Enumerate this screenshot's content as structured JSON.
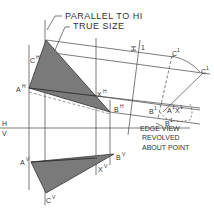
{
  "figure": {
    "callouts": {
      "parallel": "PARALLEL TO HI",
      "true_size": "TRUE SIZE",
      "edge_view_1": "EDGE VIEW",
      "edge_view_2": "REVOLVED",
      "edge_view_3": "ABOUT POINT"
    },
    "fold_lines": {
      "h": "H",
      "v": "V",
      "h_aux": "H",
      "one": "1"
    },
    "points": {
      "a_h": "A",
      "a_h_sup": "H",
      "c_h": "C",
      "c_h_sup": "H",
      "x_h": "X",
      "x_h_sup": "H",
      "b_h": "B",
      "b_h_sup": "H",
      "a_v": "A",
      "a_v_sup": "V",
      "c_v": "C",
      "c_v_sup": "V",
      "x_v": "X",
      "x_v_sup": "V",
      "b_v": "B",
      "b_v_sup": "V",
      "c_1": "C",
      "c_1_sup": "1",
      "c_1r": "C",
      "c_1r_sup": "1",
      "b_1": "B",
      "b_1_sup": "1",
      "b_1r": "B",
      "b_1r_sup": "1",
      "ax_1": "A",
      "ax_1_sup": "1",
      "ax_1b": "X",
      "ax_1b_sup": "1"
    },
    "colors": {
      "fill": "#7a7a7a",
      "line": "#3a3a3a"
    }
  }
}
